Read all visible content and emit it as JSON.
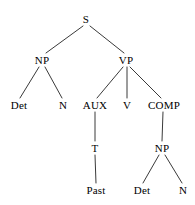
{
  "diagram": {
    "type": "syntax-tree",
    "title": "",
    "background_color": "#ffffff",
    "line_color": "#3a3a3a",
    "text_color": "#000000",
    "nodes": [
      {
        "id": "s",
        "label": "S",
        "x": 86,
        "y": 19
      },
      {
        "id": "np1",
        "label": "NP",
        "x": 42,
        "y": 60
      },
      {
        "id": "vp",
        "label": "VP",
        "x": 126,
        "y": 60
      },
      {
        "id": "det1",
        "label": "Det",
        "x": 19,
        "y": 105
      },
      {
        "id": "n1",
        "label": "N",
        "x": 63,
        "y": 105
      },
      {
        "id": "aux",
        "label": "AUX",
        "x": 95,
        "y": 105
      },
      {
        "id": "v",
        "label": "V",
        "x": 127,
        "y": 105
      },
      {
        "id": "comp",
        "label": "COMP",
        "x": 164,
        "y": 105
      },
      {
        "id": "t",
        "label": "T",
        "x": 95,
        "y": 148
      },
      {
        "id": "np2",
        "label": "NP",
        "x": 162,
        "y": 148
      },
      {
        "id": "past",
        "label": "Past",
        "x": 96,
        "y": 190
      },
      {
        "id": "det2",
        "label": "Det",
        "x": 142,
        "y": 190
      },
      {
        "id": "n2",
        "label": "N",
        "x": 183,
        "y": 190
      }
    ],
    "edges": [
      {
        "from": "s",
        "to": "np1",
        "x1": 83,
        "y1": 26,
        "x2": 46,
        "y2": 53
      },
      {
        "from": "s",
        "to": "vp",
        "x1": 90,
        "y1": 26,
        "x2": 124,
        "y2": 53
      },
      {
        "from": "np1",
        "to": "det1",
        "x1": 39,
        "y1": 67,
        "x2": 20,
        "y2": 98
      },
      {
        "from": "np1",
        "to": "n1",
        "x1": 45,
        "y1": 67,
        "x2": 62,
        "y2": 98
      },
      {
        "from": "vp",
        "to": "aux",
        "x1": 123,
        "y1": 67,
        "x2": 97,
        "y2": 98
      },
      {
        "from": "vp",
        "to": "v",
        "x1": 127,
        "y1": 67,
        "x2": 127,
        "y2": 98
      },
      {
        "from": "vp",
        "to": "comp",
        "x1": 130,
        "y1": 67,
        "x2": 161,
        "y2": 98
      },
      {
        "from": "aux",
        "to": "t",
        "x1": 95,
        "y1": 112,
        "x2": 95,
        "y2": 141
      },
      {
        "from": "comp",
        "to": "np2",
        "x1": 163,
        "y1": 112,
        "x2": 162,
        "y2": 141
      },
      {
        "from": "t",
        "to": "past",
        "x1": 95,
        "y1": 155,
        "x2": 96,
        "y2": 183
      },
      {
        "from": "np2",
        "to": "det2",
        "x1": 159,
        "y1": 155,
        "x2": 143,
        "y2": 183
      },
      {
        "from": "np2",
        "to": "n2",
        "x1": 165,
        "y1": 155,
        "x2": 182,
        "y2": 183
      }
    ]
  }
}
